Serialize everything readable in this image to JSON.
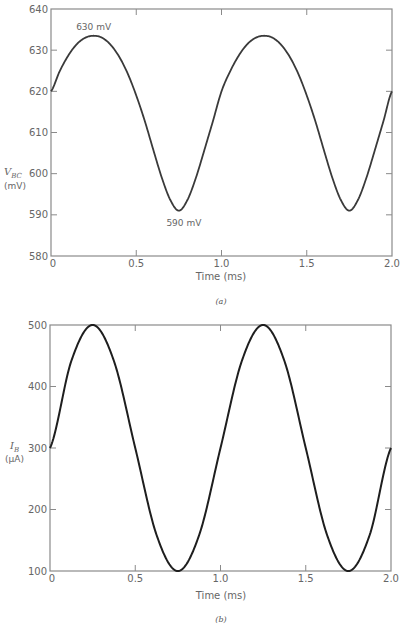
{
  "chart_data": [
    {
      "id": "a",
      "type": "line",
      "title": "",
      "caption": "(a)",
      "xlabel": "Time (ms)",
      "ylabel": "V_BC",
      "ylabel_symbol": "V",
      "ylabel_subscript": "BC",
      "ylabel_unit": "(mV)",
      "xlim": [
        0,
        2.0
      ],
      "ylim": [
        580,
        640
      ],
      "xticks": [
        "0",
        "0.5",
        "1.0",
        "1.5",
        "2.0"
      ],
      "xtick_values": [
        0,
        0.5,
        1.0,
        1.5,
        2.0
      ],
      "yticks": [
        "580",
        "590",
        "600",
        "610",
        "620",
        "630",
        "640"
      ],
      "ytick_values": [
        580,
        590,
        600,
        610,
        620,
        630,
        640
      ],
      "grid": false,
      "annotations": [
        {
          "text": "630 mV",
          "x": 0.25,
          "y": 633.5,
          "position": "above"
        },
        {
          "text": "590 mV",
          "x": 0.75,
          "y": 591,
          "position": "below"
        }
      ],
      "series": [
        {
          "name": "V_BC",
          "x": [
            0,
            0.05,
            0.1,
            0.15,
            0.2,
            0.25,
            0.3,
            0.35,
            0.4,
            0.45,
            0.5,
            0.55,
            0.6,
            0.65,
            0.7,
            0.75,
            0.8,
            0.85,
            0.9,
            0.95,
            1.0,
            1.05,
            1.1,
            1.15,
            1.2,
            1.25,
            1.3,
            1.35,
            1.4,
            1.45,
            1.5,
            1.55,
            1.6,
            1.65,
            1.7,
            1.75,
            1.8,
            1.85,
            1.9,
            1.95,
            2.0
          ],
          "values": [
            620,
            624.8,
            628.6,
            631.4,
            633.0,
            633.5,
            633.0,
            631.3,
            628.4,
            624.3,
            619.0,
            612.8,
            605.8,
            599.0,
            593.6,
            591.0,
            593.6,
            599.0,
            605.8,
            612.8,
            620,
            624.8,
            628.6,
            631.4,
            633.0,
            633.5,
            633.0,
            631.3,
            628.4,
            624.3,
            619.0,
            612.8,
            605.8,
            599.0,
            593.6,
            591.0,
            593.6,
            599.0,
            605.8,
            612.8,
            620
          ]
        }
      ]
    },
    {
      "id": "b",
      "type": "line",
      "title": "",
      "caption": "(b)",
      "xlabel": "Time (ms)",
      "ylabel": "I_B",
      "ylabel_symbol": "I",
      "ylabel_subscript": "B",
      "ylabel_unit": "(µA)",
      "xlim": [
        0,
        2.0
      ],
      "ylim": [
        100,
        500
      ],
      "xticks": [
        "0",
        "0.5",
        "1.0",
        "1.5",
        "2.0"
      ],
      "xtick_values": [
        0,
        0.5,
        1.0,
        1.5,
        2.0
      ],
      "yticks": [
        "100",
        "200",
        "300",
        "400",
        "500"
      ],
      "ytick_values": [
        100,
        200,
        300,
        400,
        500
      ],
      "grid": false,
      "series": [
        {
          "name": "I_B",
          "formula": "300 + 200*sin(2*pi*t/1.0)",
          "x": [
            0,
            0.125,
            0.25,
            0.375,
            0.5,
            0.625,
            0.75,
            0.875,
            1.0,
            1.125,
            1.25,
            1.375,
            1.5,
            1.625,
            1.75,
            1.875,
            2.0
          ],
          "values": [
            300,
            441.4,
            500,
            441.4,
            300,
            158.6,
            100,
            158.6,
            300,
            441.4,
            500,
            441.4,
            300,
            158.6,
            100,
            158.6,
            300
          ]
        }
      ]
    }
  ],
  "styles": {
    "axis_color": "#8a8a8a",
    "line_color": "#3a3a3a",
    "line_color_b": "#1e1e1e",
    "text_color": "#666666"
  }
}
